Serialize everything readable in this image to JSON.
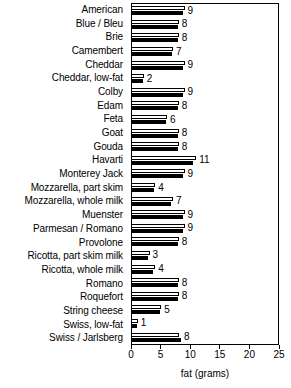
{
  "chart_data": {
    "type": "bar",
    "title": "",
    "xlabel": "fat (grams)",
    "ylabel": "",
    "xlim": [
      0,
      25
    ],
    "xticks": [
      0,
      5,
      10,
      15,
      20,
      25
    ],
    "grid": false,
    "legend": "none",
    "orientation": "horizontal",
    "categories": [
      "American",
      "Blue / Bleu",
      "Brie",
      "Camembert",
      "Cheddar",
      "Cheddar, low-fat",
      "Colby",
      "Edam",
      "Feta",
      "Goat",
      "Gouda",
      "Havarti",
      "Monterey Jack",
      "Mozzarella, part skim",
      "Mozzarella, whole milk",
      "Muenster",
      "Parmesan / Romano",
      "Provolone",
      "Ricotta, part skim milk",
      "Ricotta, whole milk",
      "Romano",
      "Roquefort",
      "String cheese",
      "Swiss, low-fat",
      "Swiss / Jarlsberg"
    ],
    "values": [
      9,
      8,
      8,
      7,
      9,
      2,
      9,
      8,
      6,
      8,
      8,
      11,
      9,
      4,
      7,
      9,
      9,
      8,
      3,
      4,
      8,
      8,
      5,
      1,
      8
    ],
    "value_labels": [
      "9",
      "8",
      "8",
      "7",
      "9",
      "2",
      "9",
      "8",
      "6",
      "8",
      "8",
      "11",
      "9",
      "4",
      "7",
      "9",
      "9",
      "8",
      "3",
      "4",
      "8",
      "8",
      "5",
      "1",
      "8"
    ],
    "series": [
      {
        "name": "outline-bar",
        "style": "white-filled-outlined",
        "values": [
          9,
          8,
          8,
          7,
          9,
          2,
          9,
          8,
          6,
          8,
          8,
          11,
          9,
          4,
          7,
          9,
          9,
          8,
          3,
          4,
          8,
          8,
          5,
          1,
          8
        ]
      },
      {
        "name": "solid-bar",
        "style": "black-filled",
        "values": [
          8.8,
          7.8,
          7.8,
          6.8,
          8.8,
          1.8,
          8.8,
          7.8,
          5.8,
          7.8,
          7.8,
          10.5,
          8.8,
          3.8,
          6.6,
          8.8,
          8.8,
          7.8,
          2.8,
          3.6,
          7.8,
          7.8,
          4.8,
          0.8,
          8.4
        ]
      }
    ]
  },
  "axis": {
    "tick_labels": [
      "0",
      "5",
      "10",
      "15",
      "20",
      "25"
    ],
    "title": "fat (grams)"
  },
  "colors": {
    "bar_outline": "#000000",
    "bar_fill_white": "#ffffff",
    "bar_fill_black": "#000000",
    "axis": "#000000",
    "background": "#ffffff",
    "text": "#000000"
  }
}
